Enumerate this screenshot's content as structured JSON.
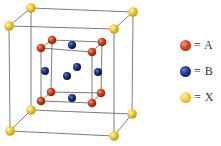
{
  "figure": {
    "title": ""
  },
  "colors": {
    "A": "#c8401f",
    "B": "#1f2f7a",
    "X": "#f0c832",
    "edge": "#555555"
  },
  "legend": {
    "items": [
      {
        "symbol": "A",
        "label": "= A",
        "color": "#c8401f"
      },
      {
        "symbol": "B",
        "label": "= B",
        "color": "#1f2f7a"
      },
      {
        "symbol": "X",
        "label": "= X",
        "color": "#f0c832"
      }
    ]
  },
  "atoms": {
    "X_count": 8,
    "A_count": 8,
    "B_count": 6
  }
}
